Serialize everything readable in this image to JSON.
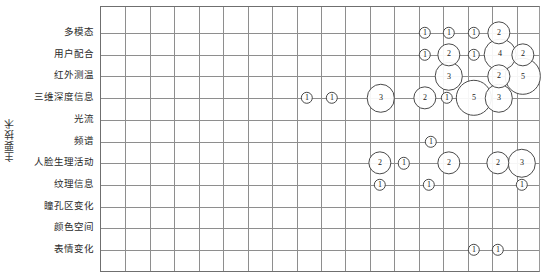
{
  "axes": {
    "y_title": "主要技术",
    "y_categories": [
      "多模态",
      "用户配合",
      "红外测温",
      "三维深度信息",
      "光流",
      "频谱",
      "人脸生理活动",
      "纹理信息",
      "瞳孔区变化",
      "颜色空间",
      "表情变化"
    ]
  },
  "style": {
    "grid_color": "#8e8e8e",
    "axis_color": "#6f6f6f",
    "bubble_stroke": "#4a4a4a",
    "bubble_fill": "#ffffff",
    "text_color": "#1a1a1a"
  },
  "chart_data": {
    "type": "scatter",
    "title": "",
    "xlabel": "",
    "ylabel": "主要技术",
    "grid": true,
    "legend": "none",
    "bubble_encoding": "count shown as number inside circle; radius scales with count",
    "categories": [
      "多模态",
      "用户配合",
      "红外测温",
      "三维深度信息",
      "光流",
      "频谱",
      "人脸生理活动",
      "纹理信息",
      "瞳孔区变化",
      "颜色空间",
      "表情变化"
    ],
    "x_gridline_count": 18,
    "points": [
      {
        "row": "多模态",
        "row_index": 0,
        "x": 424,
        "value": 1
      },
      {
        "row": "多模态",
        "row_index": 0,
        "x": 448,
        "value": 1
      },
      {
        "row": "多模态",
        "row_index": 0,
        "x": 473,
        "value": 1
      },
      {
        "row": "多模态",
        "row_index": 0,
        "x": 498,
        "value": 2
      },
      {
        "row": "用户配合",
        "row_index": 1,
        "x": 424,
        "value": 1
      },
      {
        "row": "用户配合",
        "row_index": 1,
        "x": 448,
        "value": 2
      },
      {
        "row": "用户配合",
        "row_index": 1,
        "x": 473,
        "value": 1
      },
      {
        "row": "用户配合",
        "row_index": 1,
        "x": 499,
        "value": 4
      },
      {
        "row": "用户配合",
        "row_index": 1,
        "x": 522,
        "value": 2
      },
      {
        "row": "红外测温",
        "row_index": 2,
        "x": 448,
        "value": 3
      },
      {
        "row": "红外测温",
        "row_index": 2,
        "x": 498,
        "value": 2
      },
      {
        "row": "红外测温",
        "row_index": 2,
        "x": 522,
        "value": 5
      },
      {
        "row": "三维深度信息",
        "row_index": 3,
        "x": 306,
        "value": 1
      },
      {
        "row": "三维深度信息",
        "row_index": 3,
        "x": 331,
        "value": 1
      },
      {
        "row": "三维深度信息",
        "row_index": 3,
        "x": 380,
        "value": 3
      },
      {
        "row": "三维深度信息",
        "row_index": 3,
        "x": 424,
        "value": 2
      },
      {
        "row": "三维深度信息",
        "row_index": 3,
        "x": 446,
        "value": 1
      },
      {
        "row": "三维深度信息",
        "row_index": 3,
        "x": 473,
        "value": 5
      },
      {
        "row": "三维深度信息",
        "row_index": 3,
        "x": 498,
        "value": 3
      },
      {
        "row": "频谱",
        "row_index": 5,
        "x": 430,
        "value": 1
      },
      {
        "row": "人脸生理活动",
        "row_index": 6,
        "x": 379,
        "value": 2
      },
      {
        "row": "人脸生理活动",
        "row_index": 6,
        "x": 403,
        "value": 1
      },
      {
        "row": "人脸生理活动",
        "row_index": 6,
        "x": 448,
        "value": 2
      },
      {
        "row": "人脸生理活动",
        "row_index": 6,
        "x": 497,
        "value": 2
      },
      {
        "row": "人脸生理活动",
        "row_index": 6,
        "x": 521,
        "value": 3
      },
      {
        "row": "纹理信息",
        "row_index": 7,
        "x": 379,
        "value": 1
      },
      {
        "row": "纹理信息",
        "row_index": 7,
        "x": 428,
        "value": 1
      },
      {
        "row": "纹理信息",
        "row_index": 7,
        "x": 521,
        "value": 1
      },
      {
        "row": "表情变化",
        "row_index": 10,
        "x": 473,
        "value": 1
      },
      {
        "row": "表情变化",
        "row_index": 10,
        "x": 497,
        "value": 1
      }
    ]
  }
}
